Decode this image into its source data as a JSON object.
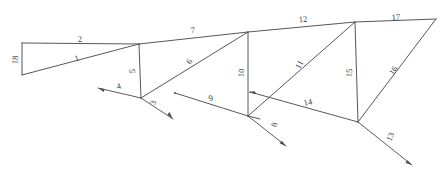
{
  "figure": {
    "type": "truss-member-numbering-diagram",
    "width": 443,
    "height": 179,
    "background_color": "#ffffff",
    "line_color": "#444444",
    "label_color": "#3a3a3a"
  },
  "nodes": [
    {
      "id": "A",
      "name": "left-top-node",
      "x": 22,
      "y": 43
    },
    {
      "id": "B",
      "name": "left-bottom-node",
      "x": 22,
      "y": 75
    },
    {
      "id": "C",
      "name": "upper-chord-node-1",
      "x": 139,
      "y": 44
    },
    {
      "id": "D",
      "name": "lower-node-1",
      "x": 141,
      "y": 98
    },
    {
      "id": "E",
      "name": "upper-chord-node-2",
      "x": 248,
      "y": 32
    },
    {
      "id": "F",
      "name": "lower-node-2",
      "x": 248,
      "y": 116
    },
    {
      "id": "G",
      "name": "upper-chord-node-3",
      "x": 355,
      "y": 22
    },
    {
      "id": "H",
      "name": "lower-node-3",
      "x": 358,
      "y": 122
    },
    {
      "id": "I",
      "name": "right-apex-node",
      "x": 436,
      "y": 19
    }
  ],
  "members": [
    {
      "id": 1,
      "name": "member-1",
      "label": "1",
      "from": "B",
      "to": "C",
      "label_x": 77,
      "label_y": 59,
      "label_rotation": -16
    },
    {
      "id": 2,
      "name": "member-2",
      "label": "2",
      "from": "A",
      "to": "C",
      "label_x": 80,
      "label_y": 40,
      "label_rotation": -4
    },
    {
      "id": 5,
      "name": "member-5",
      "label": "5",
      "from": "C",
      "to": "D",
      "label_x": 133,
      "label_y": 71,
      "label_rotation": -88
    },
    {
      "id": 6,
      "name": "member-6",
      "label": "6",
      "from": "D",
      "to": "E",
      "label_x": 190,
      "label_y": 62,
      "label_rotation": -58
    },
    {
      "id": 7,
      "name": "member-7",
      "label": "7",
      "from": "C",
      "to": "E",
      "label_x": 193,
      "label_y": 31,
      "label_rotation": -6
    },
    {
      "id": 9,
      "name": "member-9",
      "label": "9",
      "from": "Q9",
      "to": "F",
      "label_x": 211,
      "label_y": 99,
      "label_rotation": -12
    },
    {
      "id": 10,
      "name": "member-10",
      "label": "10",
      "from": "E",
      "to": "F",
      "label_x": 242,
      "label_y": 73,
      "label_rotation": -88
    },
    {
      "id": 11,
      "name": "member-11",
      "label": "11",
      "from": "F",
      "to": "G",
      "label_x": 300,
      "label_y": 65,
      "label_rotation": -60
    },
    {
      "id": 12,
      "name": "member-12",
      "label": "12",
      "from": "E",
      "to": "G",
      "label_x": 303,
      "label_y": 20,
      "label_rotation": -5
    },
    {
      "id": 14,
      "name": "member-14",
      "label": "14",
      "from": "H",
      "to": "E14",
      "label_x": 308,
      "label_y": 103,
      "label_rotation": -13
    },
    {
      "id": 15,
      "name": "member-15",
      "label": "15",
      "from": "G",
      "to": "H",
      "label_x": 350,
      "label_y": 73,
      "label_rotation": -88
    },
    {
      "id": 16,
      "name": "member-16",
      "label": "16",
      "from": "H",
      "to": "I",
      "label_x": 394,
      "label_y": 71,
      "label_rotation": -56
    },
    {
      "id": 17,
      "name": "member-17",
      "label": "17",
      "from": "G",
      "to": "I",
      "label_x": 396,
      "label_y": 18,
      "label_rotation": -3
    },
    {
      "id": 18,
      "name": "member-18",
      "label": "18",
      "from": "A",
      "to": "B",
      "label_x": 16,
      "label_y": 60,
      "label_rotation": -88
    }
  ],
  "force_vectors": [
    {
      "id": 3,
      "name": "force-3",
      "label": "3",
      "x1": 141,
      "y1": 98,
      "x2": 173,
      "y2": 119,
      "label_x": 154,
      "label_y": 103,
      "label_rotation": -68,
      "arrow_at": "end"
    },
    {
      "id": 4,
      "name": "force-4",
      "label": "4",
      "x1": 141,
      "y1": 98,
      "x2": 98,
      "y2": 88,
      "label_x": 119,
      "label_y": 87,
      "label_rotation": -18,
      "arrow_at": "end"
    },
    {
      "id": 8,
      "name": "force-8",
      "label": "8",
      "x1": 248,
      "y1": 116,
      "x2": 286,
      "y2": 146,
      "label_x": 275,
      "label_y": 125,
      "label_rotation": -72,
      "arrow_at": "end"
    },
    {
      "id": 13,
      "name": "force-13",
      "label": "13",
      "x1": 358,
      "y1": 122,
      "x2": 412,
      "y2": 165,
      "label_x": 391,
      "label_y": 137,
      "label_rotation": -68,
      "arrow_at": "end"
    }
  ],
  "endpoints": [
    {
      "name": "member-9-free-end",
      "x": 175,
      "y": 93
    },
    {
      "name": "member-14-arrow-end",
      "x": 248,
      "y": 92
    }
  ]
}
